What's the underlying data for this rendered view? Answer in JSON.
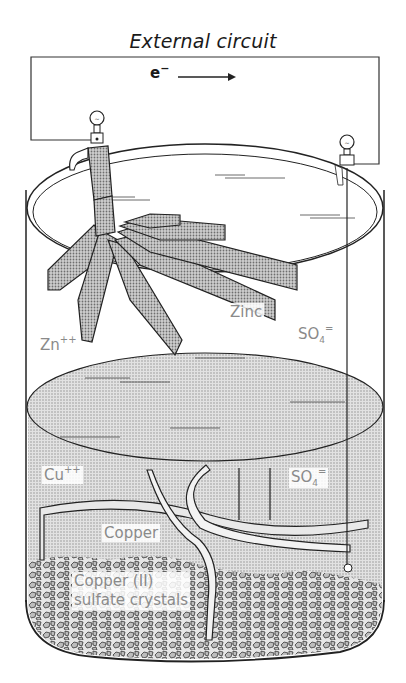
{
  "page_number_fragment": "18",
  "diagram": {
    "title": "External circuit",
    "electron_flow": {
      "symbol": "e",
      "charge": "−",
      "direction": "left-to-right"
    },
    "labels": {
      "zinc": "Zinc",
      "zinc_ion": "Zn",
      "zinc_ion_charge": "++",
      "sulfate_upper": "SO",
      "sulfate_upper_sub": "4",
      "sulfate_upper_charge": "=",
      "copper_ion": "Cu",
      "copper_ion_charge": "++",
      "sulfate_lower": "SO",
      "sulfate_lower_sub": "4",
      "sulfate_lower_charge": "=",
      "copper": "Copper",
      "crystals_line1": "Copper (II)",
      "crystals_line2": "sulfate crystals"
    },
    "colors": {
      "line": "#1a1a1a",
      "label_gray": "#8a8a8a",
      "solution_shade": "#d4d4d4",
      "electrode_shade": "#c8c8c8"
    }
  }
}
